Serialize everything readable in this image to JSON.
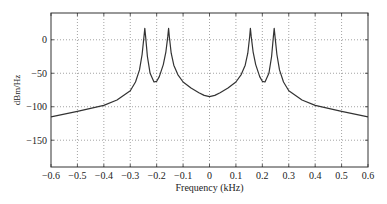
{
  "chart_data": {
    "type": "line",
    "title": "",
    "xlabel": "Frequency (kHz)",
    "ylabel": "dBm/Hz",
    "xlim": [
      -0.6,
      0.6
    ],
    "ylim": [
      -190,
      40
    ],
    "grid": true,
    "legend": null,
    "x_ticks": [
      -0.6,
      -0.5,
      -0.4,
      -0.3,
      -0.2,
      -0.1,
      0,
      0.1,
      0.2,
      0.3,
      0.4,
      0.5,
      0.6
    ],
    "x_tick_labels": [
      "−0.6",
      "−0.5",
      "−0.4",
      "−0.3",
      "−0.2",
      "−0.1",
      "0",
      "0.1",
      "0.2",
      "0.3",
      "0.4",
      "0.5",
      "0.6"
    ],
    "y_ticks": [
      0,
      -50,
      -100,
      -150
    ],
    "y_tick_labels": [
      "0",
      "−50",
      "−100",
      "−150"
    ],
    "series": [
      {
        "name": "PSD",
        "color": "#333333",
        "x": [
          -0.6,
          -0.5,
          -0.4,
          -0.35,
          -0.3,
          -0.28,
          -0.265,
          -0.255,
          -0.248,
          -0.245,
          -0.242,
          -0.235,
          -0.225,
          -0.21,
          -0.2,
          -0.19,
          -0.175,
          -0.165,
          -0.158,
          -0.155,
          -0.152,
          -0.145,
          -0.135,
          -0.12,
          -0.1,
          -0.07,
          -0.04,
          -0.02,
          0,
          0.02,
          0.04,
          0.07,
          0.1,
          0.12,
          0.135,
          0.145,
          0.152,
          0.155,
          0.158,
          0.165,
          0.175,
          0.19,
          0.2,
          0.21,
          0.225,
          0.235,
          0.242,
          0.245,
          0.248,
          0.255,
          0.265,
          0.28,
          0.3,
          0.35,
          0.4,
          0.5,
          0.6
        ],
        "y": [
          -115,
          -107,
          -98,
          -90,
          -76,
          -63,
          -45,
          -22,
          5,
          17,
          5,
          -25,
          -50,
          -63,
          -62,
          -55,
          -37,
          -18,
          5,
          17,
          5,
          -20,
          -38,
          -52,
          -63,
          -72,
          -79,
          -83,
          -85,
          -83,
          -79,
          -72,
          -63,
          -52,
          -38,
          -20,
          5,
          17,
          5,
          -18,
          -37,
          -55,
          -62,
          -63,
          -50,
          -25,
          5,
          17,
          5,
          -22,
          -45,
          -63,
          -76,
          -90,
          -98,
          -107,
          -115
        ]
      }
    ]
  }
}
